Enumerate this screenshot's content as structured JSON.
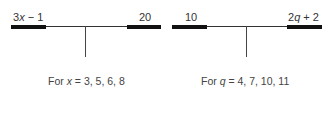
{
  "diagrams": [
    {
      "left_label_pre": "3",
      "left_label_var": "x",
      "left_label_post": " − 1",
      "right_label": "20",
      "caption_pre": "For ",
      "caption_var": "x",
      "caption_post": " = 3, 5, 6, 8"
    },
    {
      "left_label": "10",
      "right_label_pre": "2",
      "right_label_var": "q",
      "right_label_post": " + 2",
      "caption_pre": "For ",
      "caption_var": "q",
      "caption_post": " = 4, 7, 10, 11"
    }
  ],
  "colors": {
    "line": "#333333",
    "bar": "#111111",
    "text": "#333333"
  }
}
